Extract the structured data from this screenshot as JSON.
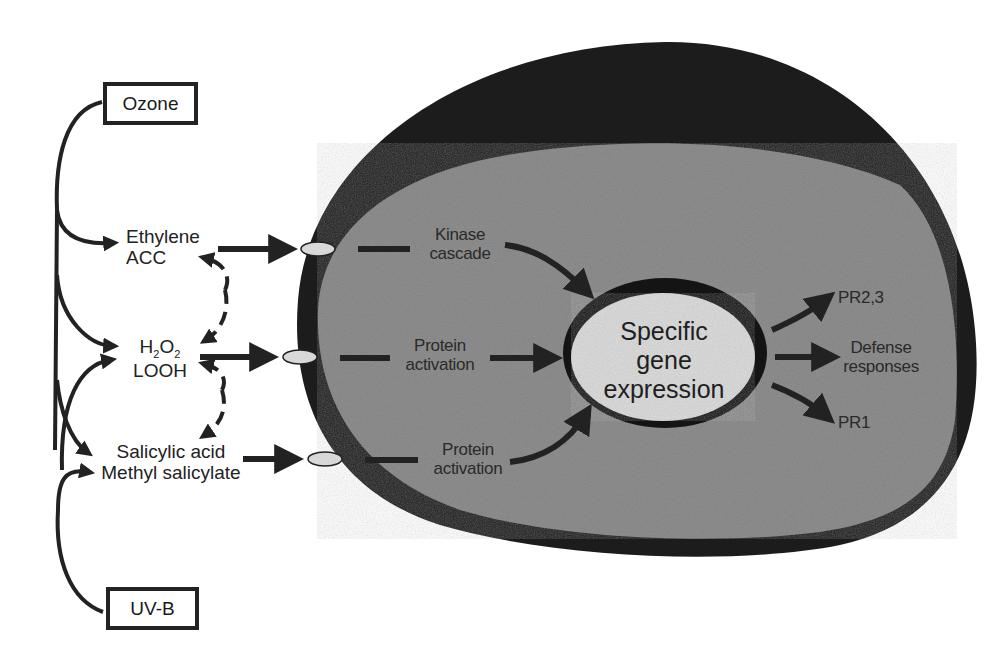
{
  "diagram": {
    "type": "signal-transduction-pathway",
    "stimuli": [
      {
        "id": "ozone",
        "label": "Ozone"
      },
      {
        "id": "uvb",
        "label": "UV-B"
      }
    ],
    "signals": [
      {
        "id": "ethylene",
        "line1": "Ethylene",
        "line2": "ACC"
      },
      {
        "id": "h2o2",
        "line1_main": "H",
        "line1_sub1": "2",
        "line1_mid": "O",
        "line1_sub2": "2",
        "line2": "LOOH"
      },
      {
        "id": "salicylic",
        "line1": "Salicylic acid",
        "line2": "Methyl salicylate"
      }
    ],
    "pathways": [
      {
        "id": "kinase",
        "line1": "Kinase",
        "line2": "cascade"
      },
      {
        "id": "protein1",
        "line1": "Protein",
        "line2": "activation"
      },
      {
        "id": "protein2",
        "line1": "Protein",
        "line2": "activation"
      }
    ],
    "nucleus": {
      "line1": "Specific",
      "line2": "gene",
      "line3": "expression"
    },
    "outputs": [
      {
        "id": "pr23",
        "label": "PR2,3"
      },
      {
        "id": "defense",
        "line1": "Defense",
        "line2": "responses"
      },
      {
        "id": "pr1",
        "label": "PR1"
      }
    ],
    "colors": {
      "cell_wall": "#1c1c1c",
      "cytoplasm": "#8d8d8d",
      "nucleus_fill": "#dcdcdc",
      "receptor_fill": "#d8d8d8",
      "arrow": "#222222"
    }
  }
}
